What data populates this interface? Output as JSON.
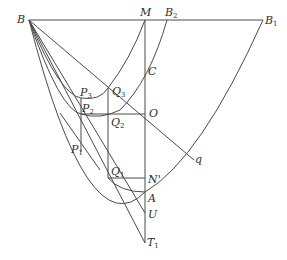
{
  "diagram": {
    "type": "geometry-construction",
    "labels": {
      "B": "B",
      "M": "M",
      "B2": {
        "base": "B",
        "sub": "2"
      },
      "B1": {
        "base": "B",
        "sub": "1"
      },
      "C": "C",
      "Q3": {
        "base": "Q",
        "sub": "3"
      },
      "P3": {
        "base": "P",
        "sub": "3"
      },
      "P2": {
        "base": "P",
        "sub": "2"
      },
      "Q2": {
        "base": "Q",
        "sub": "2"
      },
      "O": "O",
      "P1": {
        "base": "P",
        "sub": "1"
      },
      "Q1": {
        "base": "Q",
        "sub": "1"
      },
      "N_prime": "N'",
      "q": "q",
      "A": "A",
      "U": "U",
      "T1": {
        "base": "T",
        "sub": "1"
      }
    },
    "points": {
      "B": [
        29,
        20
      ],
      "M": [
        145,
        20
      ],
      "B2": [
        167,
        20
      ],
      "B1": [
        263,
        20
      ],
      "C": [
        145,
        70
      ],
      "O": [
        145,
        114
      ],
      "N_prime": [
        145,
        178
      ],
      "A": [
        145,
        192
      ],
      "U": [
        145,
        213
      ],
      "T1": [
        145,
        243
      ],
      "Q3": [
        108,
        88
      ],
      "Q2": [
        108,
        114
      ],
      "Q1": [
        108,
        178
      ],
      "P3": [
        81,
        98
      ],
      "P2": [
        81,
        114
      ],
      "P1": [
        81,
        152
      ],
      "q": [
        194,
        160
      ]
    },
    "colors": {
      "stroke": "#4a4a4a",
      "text": "#2e2e2e",
      "background": "#ffffff"
    }
  }
}
